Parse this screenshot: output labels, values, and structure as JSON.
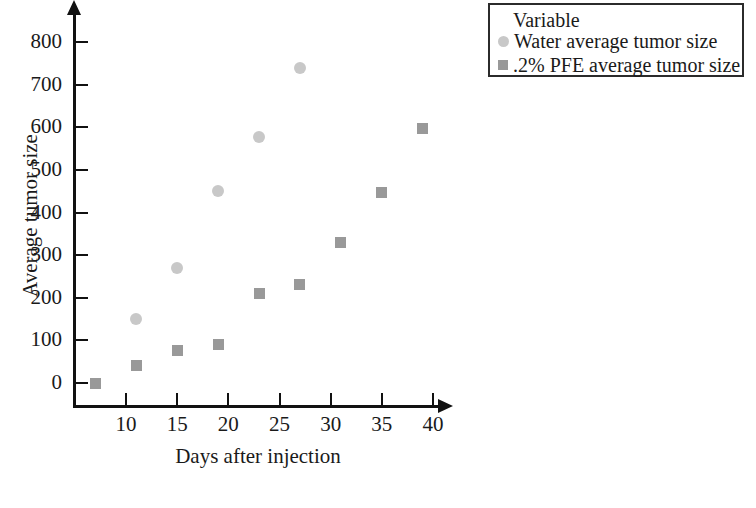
{
  "chart_data": {
    "type": "scatter",
    "title": "",
    "xlabel": "Days after injection",
    "ylabel": "Average tumor size",
    "xlim": [
      5,
      43
    ],
    "ylim": [
      -40,
      830
    ],
    "xticks": [
      10,
      15,
      20,
      25,
      30,
      35,
      40
    ],
    "yticks": [
      0,
      100,
      200,
      300,
      400,
      500,
      600,
      700,
      800
    ],
    "grid": false,
    "legend_position": "top-right",
    "legend_title": "Variable",
    "series": [
      {
        "name": "Water average tumor size",
        "marker": "circle",
        "color": "#c8c8c8",
        "x": [
          11,
          15,
          19,
          23,
          27
        ],
        "y": [
          150,
          270,
          450,
          578,
          740
        ]
      },
      {
        "name": ".2% PFE average tumor size",
        "marker": "square",
        "color": "#999999",
        "x": [
          7,
          11,
          15,
          19,
          23,
          27,
          31,
          35,
          39
        ],
        "y": [
          0,
          40,
          77,
          90,
          210,
          230,
          330,
          448,
          598
        ]
      }
    ]
  },
  "axes": {
    "x_title": "Days after injection",
    "y_title": "Average tumor size",
    "x_tick_labels": [
      "10",
      "15",
      "20",
      "25",
      "30",
      "35",
      "40"
    ],
    "y_tick_labels": [
      "0",
      "100",
      "200",
      "300",
      "400",
      "500",
      "600",
      "700",
      "800"
    ],
    "axis_color": "#111111"
  },
  "legend": {
    "title": "Variable",
    "entries": [
      {
        "label": "Water average tumor size",
        "marker": "circle",
        "color": "#c8c8c8"
      },
      {
        "label": ".2% PFE average tumor size",
        "marker": "square",
        "color": "#999999"
      }
    ]
  },
  "footer": {
    "fragment_left": "",
    "fragment_right": ""
  }
}
